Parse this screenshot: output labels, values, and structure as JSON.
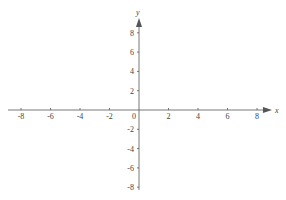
{
  "chart_data": {
    "type": "line",
    "title": "",
    "xlabel": "x",
    "ylabel": "y",
    "xlim": [
      -8,
      8
    ],
    "ylim": [
      -8,
      8
    ],
    "grid": false,
    "x_ticks": [
      -8,
      -6,
      -4,
      -2,
      0,
      2,
      4,
      6,
      8
    ],
    "y_ticks": [
      -8,
      -6,
      -4,
      -2,
      2,
      4,
      6,
      8
    ],
    "x_tick_labels": [
      "-8",
      "-6",
      "-4",
      "-2",
      "0",
      "2",
      "4",
      "6",
      "8"
    ],
    "y_tick_labels": [
      "-8",
      "-6",
      "-4",
      "-2",
      "2",
      "4",
      "6",
      "8"
    ],
    "series": [],
    "origin_label": "0"
  },
  "colors": {
    "axis": "#555555",
    "text": "#444444"
  }
}
